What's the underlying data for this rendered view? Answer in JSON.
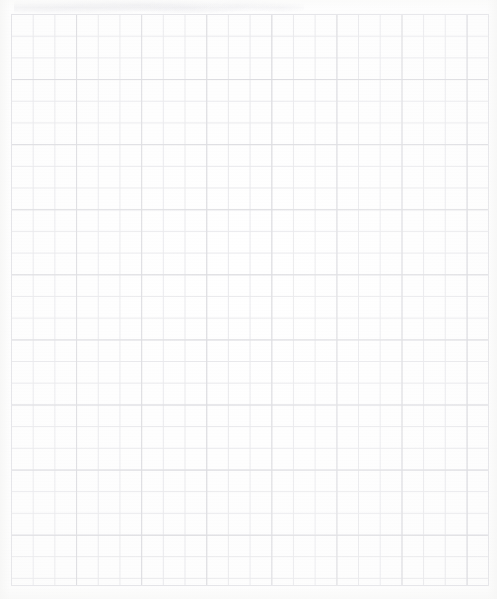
{
  "document": {
    "kind": "scanned-graph-paper",
    "title": "Graph Paper Sheet",
    "page_width": 497,
    "page_height": 599,
    "background_color": "#fdfdfc",
    "has_text": false,
    "has_handwriting": false,
    "visible_text": ""
  },
  "grid": {
    "label": "quadrille-grid",
    "origin_x": 11,
    "origin_y": 14,
    "width": 478,
    "height": 572,
    "cell_size": 21.7,
    "columns": 22,
    "rows": 26,
    "minor_line_color": "#e9e9ec",
    "major_line_color": "#dcdce0",
    "major_every_columns": 3,
    "major_every_rows": 3,
    "frame_color": "#e4e4e8",
    "line_width_minor": 1,
    "line_width_major": 1
  },
  "artifacts": {
    "top_smudge_label": "scan-smudge",
    "top_smudge_color": "#eeeef1",
    "vignette_color": "#f6f6f5",
    "grain_opacity": 0.35
  }
}
